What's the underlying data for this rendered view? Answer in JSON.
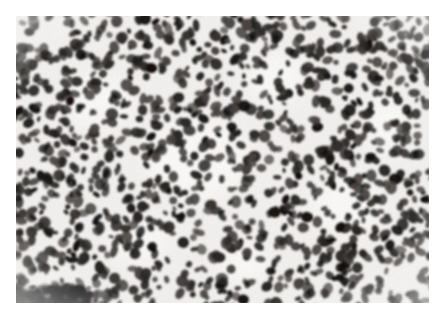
{
  "page": {
    "background_color": "#ffffff",
    "width": 446,
    "height": 320
  },
  "micrograph": {
    "name": "histopathology-micrograph",
    "alt_text": "Grayscale histopathology micrograph showing a densely cellular sheet of small round-to-oval hyperchromatic nuclei with scant pale cytoplasm, consistent with a small round blue cell tumour / high-grade lymphoid proliferation",
    "stain": "H&E",
    "color_mode": "grayscale",
    "frame": {
      "left": 16,
      "top": 16,
      "width": 413,
      "height": 287
    },
    "tone": {
      "background_pale": "#f4f2f0",
      "cytoplasm_mid": "#cfcbc7",
      "nucleus_dark": "#2a2725",
      "nucleus_darkest": "#121110",
      "nucleus_mid": "#4a4542",
      "highlight": "#fbfbfa"
    },
    "texture": {
      "description": "dense monomorphous small oval nuclei, randomly oriented, minimal intervening stroma",
      "nucleus_count": 1400,
      "nucleus_radius_min": 2.6,
      "nucleus_radius_max": 6.4,
      "pale_zone_count": 7,
      "dark_smudge_bottom_left": true
    },
    "scale_bar": null,
    "label_text": null
  }
}
